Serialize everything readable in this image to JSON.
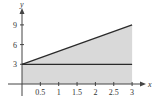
{
  "chart_data": {
    "type": "area",
    "title": "",
    "xlabel": "x",
    "ylabel": "y",
    "xlim": [
      0,
      3
    ],
    "ylim": [
      0,
      9
    ],
    "x_ticks": [
      0.5,
      1,
      1.5,
      2,
      2.5,
      3
    ],
    "x_tick_labels": [
      "0.5",
      "1",
      "1.5",
      "2",
      "2.5",
      "3"
    ],
    "y_ticks": [
      3,
      6,
      9
    ],
    "y_tick_labels": [
      "3",
      "6",
      "9"
    ],
    "grid": false,
    "legend": null,
    "series": [
      {
        "name": "upper line y = 2x + 3",
        "x": [
          0,
          3
        ],
        "y": [
          3,
          9
        ],
        "style": "line"
      },
      {
        "name": "horizontal line y = 3",
        "x": [
          0,
          3
        ],
        "y": [
          3,
          3
        ],
        "style": "line"
      },
      {
        "name": "shaded region under y = 2x + 3",
        "x": [
          0,
          3
        ],
        "y": [
          3,
          9
        ],
        "style": "fill",
        "fill_to": 0
      }
    ],
    "colors": {
      "fill": "#d9d9d9",
      "line": "#2a2a2a",
      "axis": "#444444"
    }
  }
}
